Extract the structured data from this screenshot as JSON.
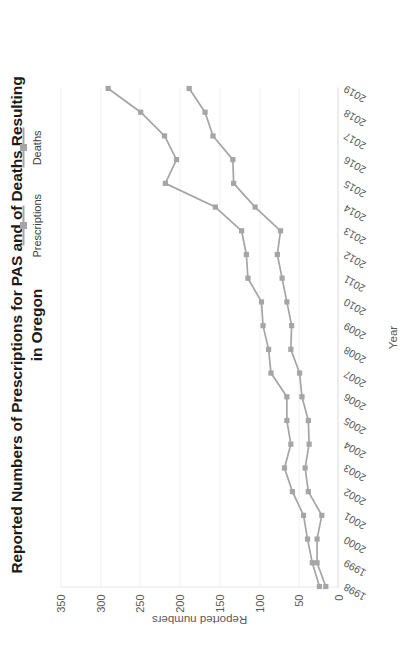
{
  "chart_data": {
    "type": "line",
    "title": "Reported Numbers of Prescriptions for PAS and of Deaths Resulting in Oregon",
    "title_lines": [
      "Reported Numbers of Prescriptions for PAS and of Deaths Resulting",
      "in Oregon"
    ],
    "xlabel": "Year",
    "ylabel": "Reported numbers",
    "ylim": [
      0,
      350
    ],
    "ytick_step": 50,
    "yticks": [
      0,
      50,
      100,
      150,
      200,
      250,
      300,
      350
    ],
    "ytick_labels": [
      "0",
      "50",
      "100",
      "150",
      "200",
      "250",
      "300",
      "350"
    ],
    "grid": true,
    "grid_axis": "y",
    "legend_position": "top-right",
    "categories": [
      "1998",
      "1999",
      "2000",
      "2001",
      "2002",
      "2003",
      "2004",
      "2005",
      "2006",
      "2007",
      "2008",
      "2009",
      "2010",
      "2011",
      "2012",
      "2013",
      "2014",
      "2015",
      "2016",
      "2017",
      "2018",
      "2019"
    ],
    "x": [
      1998,
      1999,
      2000,
      2001,
      2002,
      2003,
      2004,
      2005,
      2006,
      2007,
      2008,
      2009,
      2010,
      2011,
      2012,
      2013,
      2014,
      2015,
      2016,
      2017,
      2018,
      2019
    ],
    "series": [
      {
        "name": "Prescriptions",
        "name_wrapped": [
          "Prescription",
          "s"
        ],
        "color": "#a5a5a5",
        "marker": "square",
        "values": [
          24,
          33,
          39,
          44,
          58,
          68,
          60,
          65,
          65,
          85,
          88,
          95,
          97,
          114,
          116,
          122,
          155,
          218,
          204,
          219,
          249,
          290
        ]
      },
      {
        "name": "Deaths",
        "name_wrapped": [
          "Deaths"
        ],
        "color": "#a5a5a5",
        "marker": "square",
        "values": [
          16,
          27,
          27,
          21,
          38,
          42,
          37,
          38,
          46,
          49,
          60,
          59,
          65,
          71,
          77,
          73,
          105,
          132,
          133,
          158,
          168,
          188
        ]
      }
    ]
  },
  "legend": {
    "items": [
      {
        "label": "Prescriptions",
        "color": "#a5a5a5"
      },
      {
        "label": "Deaths",
        "color": "#a5a5a5"
      }
    ]
  }
}
